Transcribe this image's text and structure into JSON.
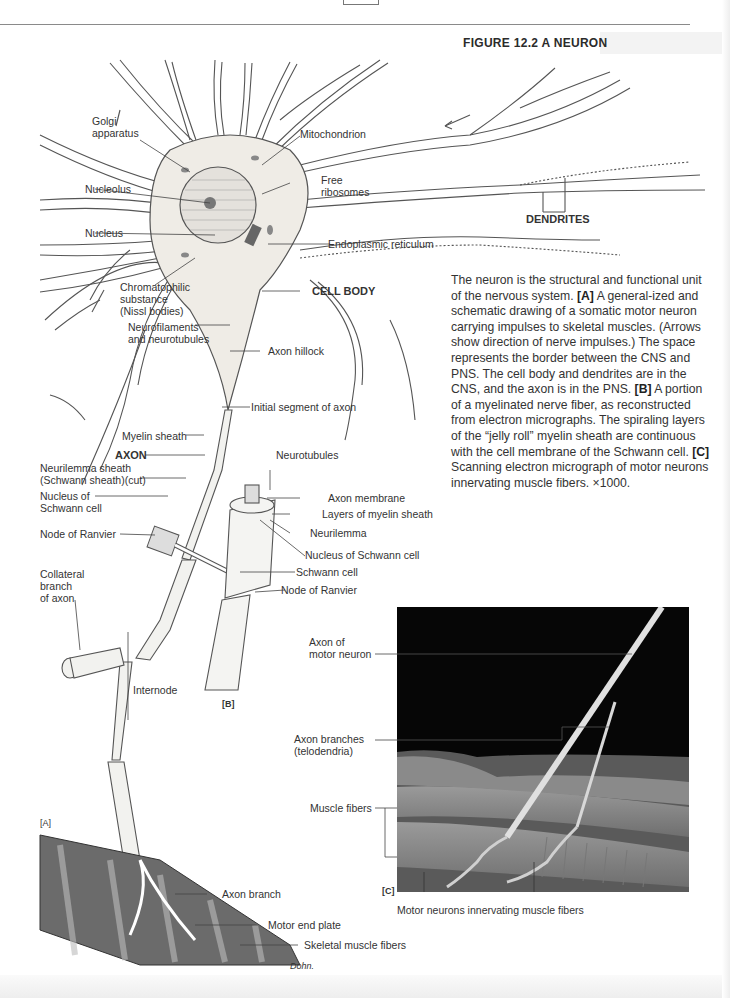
{
  "page": {
    "figure_title": "FIGURE 12.2  A NEURON"
  },
  "caption": {
    "intro": "The neuron is the structural and functional unit of the nervous system. ",
    "a_tag": "[A]",
    "a_text": " A general-ized and schematic drawing of a somatic motor neuron carrying impulses to skeletal muscles. (Arrows show direction of nerve impulses.) The space represents the border between the CNS and PNS. The cell body and dendrites are in the CNS, and the axon is in the PNS. ",
    "b_tag": "[B]",
    "b_text": " A portion of a myelinated nerve fiber, as reconstructed from electron micrographs. The spiraling layers of the “jelly roll” myelin sheath are continuous with the cell membrane of the Schwann cell. ",
    "c_tag": "[C]",
    "c_text": " Scanning electron micrograph of motor neurons innervating muscle fibers. ×1000."
  },
  "panel_a": {
    "tag": "[A]",
    "labels": {
      "golgi": "Golgi\napparatus",
      "mitochondrion": "Mitochondrion",
      "free_ribosomes": "Free\nribosomes",
      "nucleolus": "Nucleolus",
      "nucleus": "Nucleus",
      "dendrites": "DENDRITES",
      "er": "Endoplasmic reticulum",
      "chromatophilic": "Chromatophilic\nsubstance\n(Nissl bodies)",
      "cell_body": "CELL BODY",
      "neurofilaments": "Neurofilaments\nand neurotubules",
      "axon_hillock": "Axon hillock",
      "initial_segment": "Initial segment of axon",
      "myelin_sheath": "Myelin sheath",
      "axon": "AXON",
      "neurilemma_sheath": "Neurilemma sheath\n(Schwann sheath)(cut)",
      "nucleus_schwann": "Nucleus of\nSchwann cell",
      "node_ranvier": "Node of Ranvier",
      "collateral": "Collateral\nbranch\nof axon",
      "internode": "Internode",
      "axon_branch": "Axon branch",
      "motor_end_plate": "Motor end plate",
      "skeletal_muscle": "Skeletal muscle fibers",
      "signature": "Dohn."
    }
  },
  "panel_b": {
    "tag": "[B]",
    "labels": {
      "neurotubules": "Neurotubules",
      "axon_membrane": "Axon membrane",
      "layers_myelin": "Layers of myelin sheath",
      "neurilemma": "Neurilemma",
      "nucleus_schwann": "Nucleus of Schwann cell",
      "schwann_cell": "Schwann cell",
      "node_ranvier": "Node of Ranvier"
    }
  },
  "panel_c": {
    "tag": "[C]",
    "labels": {
      "axon_motor": "Axon of\nmotor neuron",
      "axon_branches": "Axon branches\n(telodendria)",
      "muscle_fibers": "Muscle fibers",
      "motor_neurons": "Motor neurons innervating muscle fibers"
    }
  }
}
